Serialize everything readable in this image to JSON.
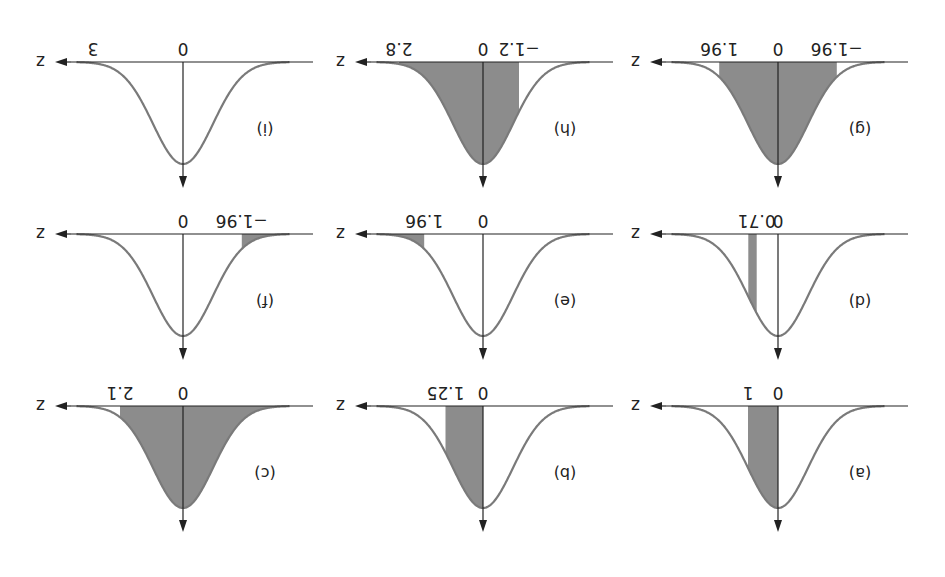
{
  "chart_data": {
    "type": "area",
    "title": "",
    "orientation": "rotated-180",
    "panels": [
      {
        "id": "a",
        "label": "(a)",
        "axis_label": "z",
        "ticks": [
          "0",
          "1"
        ],
        "tick_values": [
          0,
          1
        ],
        "shade": [
          [
            0,
            1
          ]
        ]
      },
      {
        "id": "b",
        "label": "(b)",
        "axis_label": "z",
        "ticks": [
          "0",
          "1.25"
        ],
        "tick_values": [
          0,
          1.25
        ],
        "shade": [
          [
            0,
            1.25
          ]
        ]
      },
      {
        "id": "c",
        "label": "(c)",
        "axis_label": "z",
        "ticks": [
          "0",
          "2.1"
        ],
        "tick_values": [
          0,
          2.1
        ],
        "shade": [
          [
            -4,
            2.1
          ]
        ]
      },
      {
        "id": "d",
        "label": "(d)",
        "axis_label": "z",
        "ticks": [
          "0",
          "0.71"
        ],
        "tick_values": [
          0,
          0.71
        ],
        "shade": [
          [
            0.71,
            0.99
          ]
        ]
      },
      {
        "id": "e",
        "label": "(e)",
        "axis_label": "z",
        "ticks": [
          "0",
          "1.96"
        ],
        "tick_values": [
          0,
          1.96
        ],
        "shade": [
          [
            1.96,
            4
          ]
        ]
      },
      {
        "id": "f",
        "label": "(f)",
        "axis_label": "z",
        "ticks": [
          "−1.96",
          "0"
        ],
        "tick_values": [
          -1.96,
          0
        ],
        "shade": [
          [
            -4,
            -1.96
          ]
        ]
      },
      {
        "id": "g",
        "label": "(g)",
        "axis_label": "z",
        "ticks": [
          "−1.96",
          "0",
          "1.96"
        ],
        "tick_values": [
          -1.96,
          0,
          1.96
        ],
        "shade": [
          [
            -1.96,
            1.96
          ]
        ]
      },
      {
        "id": "h",
        "label": "(h)",
        "axis_label": "z",
        "ticks": [
          "−1.2",
          "0",
          "2.8"
        ],
        "tick_values": [
          -1.2,
          0,
          2.8
        ],
        "shade": [
          [
            -1.2,
            2.8
          ]
        ]
      },
      {
        "id": "i",
        "label": "(i)",
        "axis_label": "z",
        "ticks": [
          "0",
          "3"
        ],
        "tick_values": [
          0,
          3
        ],
        "shade": [
          [
            3,
            4
          ]
        ]
      }
    ],
    "xlabel": "z",
    "ylabel": "",
    "colors": {
      "curve": "#7a7a7a",
      "shade": "#8c8c8c",
      "axis": "#222222"
    }
  }
}
